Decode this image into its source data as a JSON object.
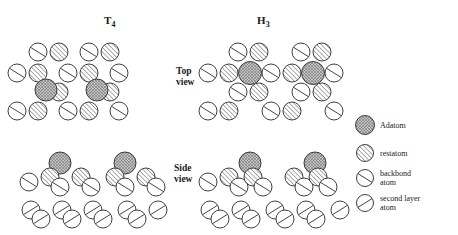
{
  "figure": {
    "width": 458,
    "height": 235,
    "background": "#ffffff",
    "columns": [
      {
        "id": "t4",
        "label_main": "T",
        "label_sub": "4",
        "x": 104,
        "y": 14
      },
      {
        "id": "h3",
        "label_main": "H",
        "label_sub": "3",
        "x": 257,
        "y": 14
      }
    ],
    "row_labels": [
      {
        "id": "top-view",
        "line1": "Top",
        "line2": "view",
        "x": 176,
        "y": 66
      },
      {
        "id": "side-view",
        "line1": "Side",
        "line2": "view",
        "x": 174,
        "y": 163
      }
    ]
  },
  "styles": {
    "outline": "#2a2a2a",
    "hatch_line": "#3a3a3a",
    "adatom_fill": "#b8b8b8",
    "white_fill": "#ffffff",
    "stroke_width": 0.9
  },
  "atom_types": {
    "adatom": {
      "name": "Adatom",
      "pattern": "cross-hatch",
      "fill": "#b8b8b8"
    },
    "restatom": {
      "name": "restatom",
      "pattern": "diagonal-dense",
      "fill": "#ffffff"
    },
    "backbond": {
      "name": "backbond atom",
      "pattern": "single-slash-down",
      "fill": "#ffffff"
    },
    "second_layer": {
      "name": "second layer atom",
      "pattern": "single-slash-up",
      "fill": "#ffffff"
    }
  },
  "legend": {
    "items": [
      {
        "id": "adatom",
        "type": "adatom",
        "line1": "Adatom",
        "line2": "",
        "cx": 365,
        "cy": 125,
        "r": 9.5,
        "tx": 380,
        "ty": 121
      },
      {
        "id": "restatom",
        "type": "restatom",
        "line1": "restatom",
        "line2": "",
        "cx": 365,
        "cy": 153,
        "r": 8.5,
        "tx": 380,
        "ty": 149
      },
      {
        "id": "backbond",
        "type": "backbond",
        "line1": "backbond",
        "line2": "atom",
        "cx": 365,
        "cy": 178,
        "r": 8.5,
        "tx": 380,
        "ty": 169
      },
      {
        "id": "second-layer",
        "type": "second_layer",
        "line1": "second  layer",
        "line2": "atom",
        "cx": 365,
        "cy": 203,
        "r": 8.5,
        "tx": 380,
        "ty": 194
      }
    ]
  },
  "atoms": {
    "t4_top": [
      {
        "type": "backbond",
        "cx": 38,
        "cy": 52,
        "r": 9
      },
      {
        "type": "restatom",
        "cx": 59,
        "cy": 52,
        "r": 9
      },
      {
        "type": "backbond",
        "cx": 89,
        "cy": 52,
        "r": 9
      },
      {
        "type": "restatom",
        "cx": 110,
        "cy": 52,
        "r": 9
      },
      {
        "type": "backbond",
        "cx": 17,
        "cy": 73,
        "r": 9
      },
      {
        "type": "restatom",
        "cx": 38,
        "cy": 73,
        "r": 9
      },
      {
        "type": "backbond",
        "cx": 68,
        "cy": 73,
        "r": 9
      },
      {
        "type": "restatom",
        "cx": 89,
        "cy": 73,
        "r": 9
      },
      {
        "type": "backbond",
        "cx": 119,
        "cy": 73,
        "r": 9
      },
      {
        "type": "restatom",
        "cx": 59,
        "cy": 92,
        "r": 9
      },
      {
        "type": "adatom",
        "cx": 46,
        "cy": 90,
        "r": 11
      },
      {
        "type": "restatom",
        "cx": 110,
        "cy": 92,
        "r": 9
      },
      {
        "type": "adatom",
        "cx": 97,
        "cy": 90,
        "r": 11
      },
      {
        "type": "backbond",
        "cx": 17,
        "cy": 111,
        "r": 9
      },
      {
        "type": "restatom",
        "cx": 38,
        "cy": 111,
        "r": 9
      },
      {
        "type": "backbond",
        "cx": 68,
        "cy": 111,
        "r": 9
      },
      {
        "type": "restatom",
        "cx": 89,
        "cy": 111,
        "r": 9
      },
      {
        "type": "backbond",
        "cx": 119,
        "cy": 111,
        "r": 9
      }
    ],
    "h3_top": [
      {
        "type": "backbond",
        "cx": 238,
        "cy": 52,
        "r": 9
      },
      {
        "type": "restatom",
        "cx": 259,
        "cy": 52,
        "r": 9
      },
      {
        "type": "backbond",
        "cx": 301,
        "cy": 52,
        "r": 9
      },
      {
        "type": "restatom",
        "cx": 322,
        "cy": 52,
        "r": 9
      },
      {
        "type": "backbond",
        "cx": 208,
        "cy": 73,
        "r": 9
      },
      {
        "type": "restatom",
        "cx": 229,
        "cy": 73,
        "r": 9
      },
      {
        "type": "backbond",
        "cx": 271,
        "cy": 73,
        "r": 9
      },
      {
        "type": "restatom",
        "cx": 292,
        "cy": 73,
        "r": 9
      },
      {
        "type": "backbond",
        "cx": 334,
        "cy": 73,
        "r": 9
      },
      {
        "type": "adatom",
        "cx": 250,
        "cy": 73,
        "r": 11.5
      },
      {
        "type": "adatom",
        "cx": 313,
        "cy": 73,
        "r": 11.5
      },
      {
        "type": "backbond",
        "cx": 238,
        "cy": 92,
        "r": 9
      },
      {
        "type": "restatom",
        "cx": 259,
        "cy": 92,
        "r": 9
      },
      {
        "type": "backbond",
        "cx": 301,
        "cy": 92,
        "r": 9
      },
      {
        "type": "restatom",
        "cx": 322,
        "cy": 92,
        "r": 9
      },
      {
        "type": "backbond",
        "cx": 208,
        "cy": 111,
        "r": 9
      },
      {
        "type": "restatom",
        "cx": 229,
        "cy": 111,
        "r": 9
      },
      {
        "type": "backbond",
        "cx": 271,
        "cy": 111,
        "r": 9
      },
      {
        "type": "restatom",
        "cx": 292,
        "cy": 111,
        "r": 9
      },
      {
        "type": "backbond",
        "cx": 334,
        "cy": 111,
        "r": 9
      }
    ],
    "t4_side": [
      {
        "type": "adatom",
        "cx": 60,
        "cy": 163,
        "r": 11
      },
      {
        "type": "adatom",
        "cx": 125,
        "cy": 163,
        "r": 11
      },
      {
        "type": "backbond",
        "cx": 29,
        "cy": 182,
        "r": 9
      },
      {
        "type": "restatom",
        "cx": 50,
        "cy": 177,
        "r": 9
      },
      {
        "type": "backbond",
        "cx": 60,
        "cy": 187,
        "r": 9
      },
      {
        "type": "restatom",
        "cx": 81,
        "cy": 177,
        "r": 9
      },
      {
        "type": "backbond",
        "cx": 91,
        "cy": 187,
        "r": 9
      },
      {
        "type": "restatom",
        "cx": 115,
        "cy": 177,
        "r": 9
      },
      {
        "type": "backbond",
        "cx": 125,
        "cy": 187,
        "r": 9
      },
      {
        "type": "restatom",
        "cx": 146,
        "cy": 177,
        "r": 9
      },
      {
        "type": "backbond",
        "cx": 156,
        "cy": 187,
        "r": 9
      },
      {
        "type": "second_layer",
        "cx": 31,
        "cy": 210,
        "r": 9
      },
      {
        "type": "second_layer",
        "cx": 41,
        "cy": 219,
        "r": 9
      },
      {
        "type": "second_layer",
        "cx": 62,
        "cy": 210,
        "r": 9
      },
      {
        "type": "second_layer",
        "cx": 72,
        "cy": 219,
        "r": 9
      },
      {
        "type": "second_layer",
        "cx": 93,
        "cy": 210,
        "r": 9
      },
      {
        "type": "second_layer",
        "cx": 103,
        "cy": 219,
        "r": 9
      },
      {
        "type": "second_layer",
        "cx": 127,
        "cy": 210,
        "r": 9
      },
      {
        "type": "second_layer",
        "cx": 137,
        "cy": 219,
        "r": 9
      },
      {
        "type": "second_layer",
        "cx": 158,
        "cy": 210,
        "r": 9
      }
    ],
    "h3_side": [
      {
        "type": "adatom",
        "cx": 250,
        "cy": 163,
        "r": 11
      },
      {
        "type": "adatom",
        "cx": 315,
        "cy": 163,
        "r": 11
      },
      {
        "type": "backbond",
        "cx": 208,
        "cy": 182,
        "r": 9
      },
      {
        "type": "restatom",
        "cx": 229,
        "cy": 177,
        "r": 9
      },
      {
        "type": "backbond",
        "cx": 239,
        "cy": 187,
        "r": 9
      },
      {
        "type": "restatom",
        "cx": 253,
        "cy": 177,
        "r": 9
      },
      {
        "type": "backbond",
        "cx": 263,
        "cy": 187,
        "r": 9
      },
      {
        "type": "restatom",
        "cx": 294,
        "cy": 177,
        "r": 9
      },
      {
        "type": "backbond",
        "cx": 304,
        "cy": 187,
        "r": 9
      },
      {
        "type": "restatom",
        "cx": 318,
        "cy": 177,
        "r": 9
      },
      {
        "type": "backbond",
        "cx": 328,
        "cy": 187,
        "r": 9
      },
      {
        "type": "second_layer",
        "cx": 210,
        "cy": 210,
        "r": 9
      },
      {
        "type": "second_layer",
        "cx": 220,
        "cy": 219,
        "r": 9
      },
      {
        "type": "second_layer",
        "cx": 241,
        "cy": 210,
        "r": 9
      },
      {
        "type": "second_layer",
        "cx": 251,
        "cy": 219,
        "r": 9
      },
      {
        "type": "second_layer",
        "cx": 275,
        "cy": 210,
        "r": 9
      },
      {
        "type": "second_layer",
        "cx": 285,
        "cy": 219,
        "r": 9
      },
      {
        "type": "second_layer",
        "cx": 306,
        "cy": 210,
        "r": 9
      },
      {
        "type": "second_layer",
        "cx": 316,
        "cy": 219,
        "r": 9
      },
      {
        "type": "second_layer",
        "cx": 340,
        "cy": 210,
        "r": 9
      }
    ]
  }
}
